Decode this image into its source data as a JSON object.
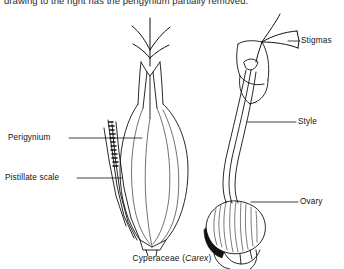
{
  "page": {
    "width": 344,
    "height": 269,
    "background_color": "#ffffff",
    "ink_color": "#111111"
  },
  "body_text": {
    "continuation_line": "drawing to the right has the perigynium partially removed."
  },
  "figure": {
    "caption_genus_family": "Cyperaceae (",
    "caption_genus": "Carex",
    "caption_close": ")",
    "caption_full": "Cyperaceae (Carex)",
    "left_drawing_name": "whole-perigynium",
    "right_drawing_name": "perigynium-partially-removed"
  },
  "labels": {
    "perigynium": "Perigynium",
    "pistillate_scale": "Pistillate scale",
    "stigmas": "Stigmas",
    "style": "Style",
    "ovary": "Ovary"
  }
}
